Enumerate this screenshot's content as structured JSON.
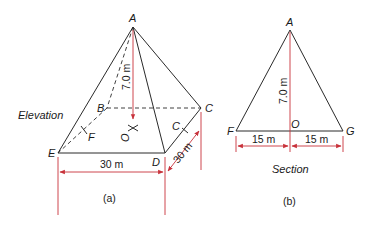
{
  "figure_a": {
    "caption": "(a)",
    "view_label": "Elevation",
    "points": {
      "A": "A",
      "B": "B",
      "C": "C",
      "C2": "C",
      "D": "D",
      "E": "E",
      "F": "F",
      "O": "O"
    },
    "height_label": "7.0 m",
    "base_width_label": "30 m",
    "base_depth_label": "30 m"
  },
  "figure_b": {
    "caption": "(b)",
    "view_label": "Section",
    "points": {
      "A": "A",
      "F": "F",
      "G": "G",
      "O": "O"
    },
    "height_label": "7.0 m",
    "left_half_label": "15 m",
    "right_half_label": "15 m"
  },
  "colors": {
    "line": "#2a2a2a",
    "dimension": "#c8313a",
    "text": "#1a1a1a"
  }
}
